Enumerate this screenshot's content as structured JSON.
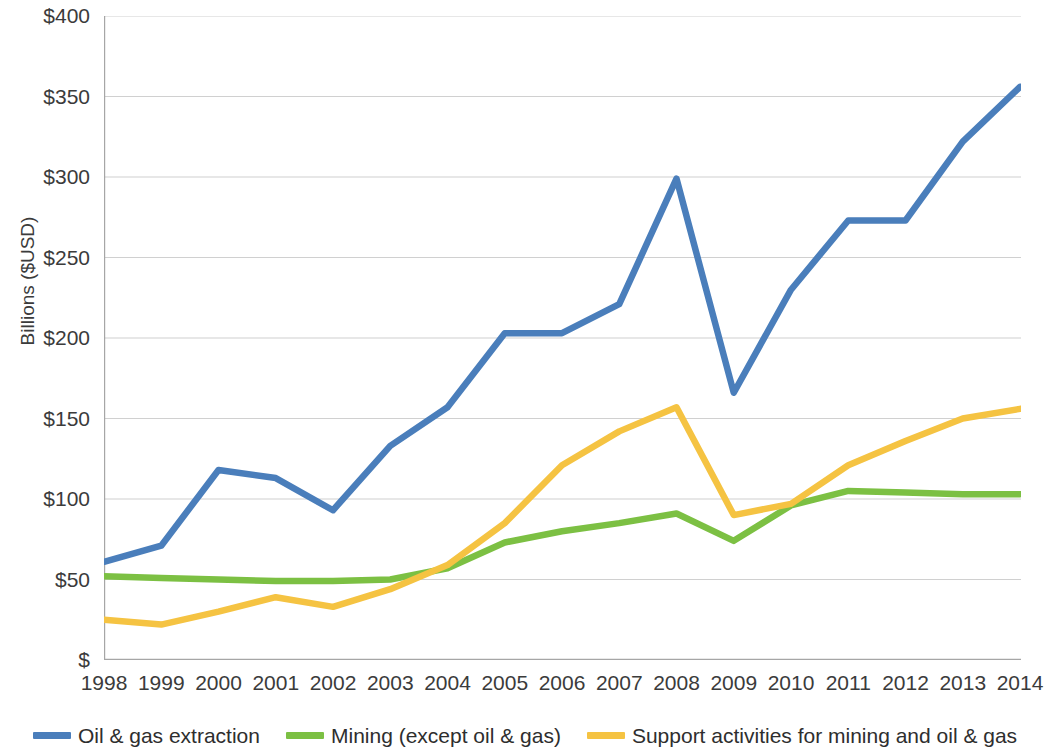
{
  "chart_data": {
    "type": "line",
    "title": "",
    "xlabel": "",
    "ylabel": "Billions ($USD)",
    "x": [
      1998,
      1999,
      2000,
      2001,
      2002,
      2003,
      2004,
      2005,
      2006,
      2007,
      2008,
      2009,
      2010,
      2011,
      2012,
      2013,
      2014
    ],
    "categories": [
      "1998",
      "1999",
      "2000",
      "2001",
      "2002",
      "2003",
      "2004",
      "2005",
      "2006",
      "2007",
      "2008",
      "2009",
      "2010",
      "2011",
      "2012",
      "2013",
      "2014"
    ],
    "xlim": [
      1998,
      2014
    ],
    "ylim": [
      0,
      400
    ],
    "y_ticks": [
      0,
      50,
      100,
      150,
      200,
      250,
      300,
      350,
      400
    ],
    "y_tick_labels": [
      "$",
      "$50",
      "$100",
      "$150",
      "$200",
      "$250",
      "$300",
      "$350",
      "$400"
    ],
    "grid": "horizontal",
    "legend_position": "bottom",
    "series": [
      {
        "name": "Oil & gas extraction",
        "color": "#4a7ebb",
        "values": [
          61,
          71,
          118,
          113,
          93,
          133,
          157,
          203,
          203,
          221,
          299,
          166,
          230,
          273,
          273,
          322,
          356
        ]
      },
      {
        "name": "Mining (except oil & gas)",
        "color": "#7cc043",
        "values": [
          52,
          51,
          50,
          49,
          49,
          50,
          57,
          73,
          80,
          85,
          91,
          74,
          96,
          105,
          104,
          103,
          103
        ]
      },
      {
        "name": "Support activities for mining and oil & gas",
        "color": "#f5c342",
        "values": [
          25,
          22,
          30,
          39,
          33,
          44,
          59,
          85,
          121,
          142,
          157,
          90,
          97,
          121,
          136,
          150,
          156
        ]
      }
    ]
  },
  "axis": {
    "y_title": "Billions ($USD)"
  },
  "legend": {
    "items": [
      {
        "label": "Oil & gas extraction",
        "color": "#4a7ebb"
      },
      {
        "label": "Mining (except oil & gas)",
        "color": "#7cc043"
      },
      {
        "label": "Support activities for mining and oil & gas",
        "color": "#f5c342"
      }
    ]
  },
  "colors": {
    "axis_line": "#a6a6a6",
    "grid_line": "#d0d0d0",
    "text": "#3b3b3b",
    "background": "#ffffff"
  }
}
